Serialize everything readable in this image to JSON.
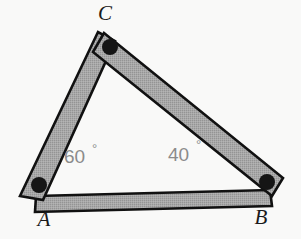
{
  "figure": {
    "kind": "triangle-linkage-diagram",
    "background_color": "#f9f9f8",
    "bar_fill_color": "#a3a3a3",
    "bar_outline_color": "#111111",
    "rivet_color": "#151515",
    "angle_label_color": "#8b8b8b",
    "vertex_label_color": "#1a1a1a"
  },
  "vertices": [
    {
      "id": "A",
      "label": "A",
      "x": 32,
      "y": 192,
      "label_x": 44,
      "label_y": 226,
      "rivet_x": 39,
      "rivet_y": 185,
      "rivet_r": 8
    },
    {
      "id": "B",
      "label": "B",
      "x": 272,
      "y": 186,
      "label_x": 261,
      "label_y": 224,
      "rivet_x": 267,
      "rivet_y": 182,
      "rivet_r": 8
    },
    {
      "id": "C",
      "label": "C",
      "x": 110,
      "y": 38,
      "label_x": 105,
      "label_y": 20,
      "rivet_x": 110,
      "rivet_y": 47,
      "rivet_r": 8
    }
  ],
  "bars": [
    {
      "id": "AB",
      "from": "A",
      "to": "B",
      "name": "bar-a-b",
      "points": "36,196 270,190 272,206 35,212"
    },
    {
      "id": "AC",
      "from": "A",
      "to": "C",
      "name": "bar-a-c",
      "points": "20,196 98,32 115,41 43,200"
    },
    {
      "id": "CB",
      "from": "C",
      "to": "B",
      "name": "bar-c-b",
      "points": "104,33 283,178 272,196 93,52"
    }
  ],
  "angles": [
    {
      "id": "angle-A",
      "vertex": "A",
      "value": "60",
      "degree_symbol": "°",
      "text": "60°",
      "x": 64,
      "y": 163,
      "deg_x": 92,
      "deg_y": 153
    },
    {
      "id": "angle-B",
      "vertex": "B",
      "value": "40",
      "degree_symbol": "°",
      "text": "40°",
      "x": 168,
      "y": 161,
      "deg_x": 196,
      "deg_y": 149
    }
  ]
}
